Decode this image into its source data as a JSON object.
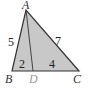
{
  "diagram": {
    "type": "triangle",
    "fill_color": "#c8c8c8",
    "stroke_color": "#333333",
    "points": {
      "A": {
        "label": "A",
        "x": 26,
        "y": 10
      },
      "B": {
        "label": "B",
        "x": 12,
        "y": 71
      },
      "D": {
        "label": "D",
        "x": 33,
        "y": 71
      },
      "C": {
        "label": "C",
        "x": 79,
        "y": 71
      }
    },
    "segment_lengths": {
      "AB": "5",
      "AC": "7",
      "BD": "2",
      "DC": "4"
    }
  }
}
